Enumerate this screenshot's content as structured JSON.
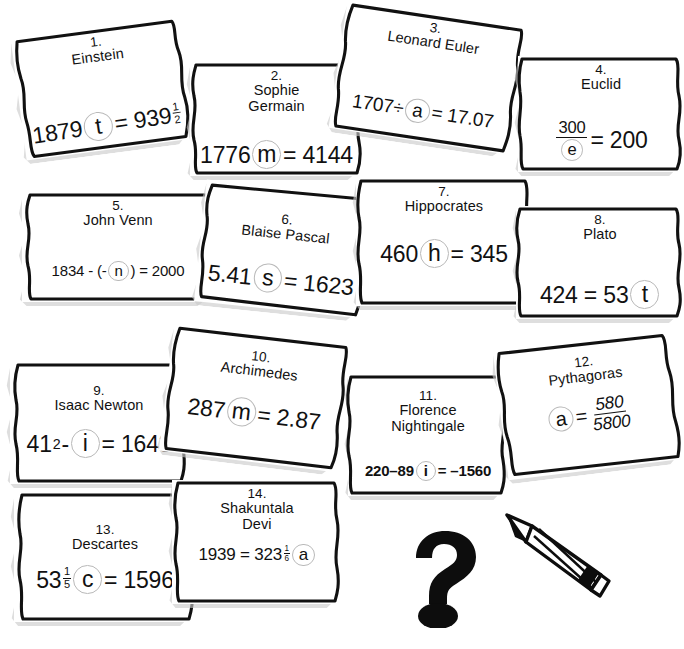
{
  "sheet": {
    "width": 684,
    "height": 649,
    "background": "#ffffff",
    "ink_color": "#111111",
    "bubble_color": "#b9b9b9",
    "shadow_color": "#c9c9c9"
  },
  "cards": [
    {
      "number": "1.",
      "name": "Einstein",
      "equation_text": "1879 t = 939 1/2",
      "eq_parts": [
        {
          "t": "1879",
          "k": "plain"
        },
        {
          "t": "t",
          "k": "bubble"
        },
        {
          "t": " = 939",
          "k": "plain"
        },
        {
          "t": "1/2",
          "k": "mixfrac",
          "n": "1",
          "d": "2"
        }
      ]
    },
    {
      "number": "2.",
      "name": "Sophie\nGermain",
      "equation_text": "1776 m = 4144",
      "eq_parts": [
        {
          "t": "1776",
          "k": "plain"
        },
        {
          "t": "m",
          "k": "bubble"
        },
        {
          "t": " = 4144",
          "k": "plain"
        }
      ]
    },
    {
      "number": "3.",
      "name": "Leonard Euler",
      "equation_text": "1707 ÷ a = 17.07",
      "eq_parts": [
        {
          "t": "1707÷",
          "k": "plain"
        },
        {
          "t": "a",
          "k": "bubble"
        },
        {
          "t": "= 17.07",
          "k": "plain"
        }
      ]
    },
    {
      "number": "4.",
      "name": "Euclid",
      "equation_text": "300 / e = 200",
      "eq_parts": [
        {
          "t": "300/e",
          "k": "frac",
          "n": "300",
          "d": "e",
          "d_bubble": true
        },
        {
          "t": " = 200",
          "k": "plain"
        }
      ]
    },
    {
      "number": "5.",
      "name": "John Venn",
      "equation_text": "1834 - (-n) = 2000",
      "eq_parts": [
        {
          "t": "1834 - (-",
          "k": "plain"
        },
        {
          "t": "n",
          "k": "bubble"
        },
        {
          "t": ") = 2000",
          "k": "plain"
        }
      ]
    },
    {
      "number": "6.",
      "name": "Blaise Pascal",
      "equation_text": "5.41 s = 1623",
      "eq_parts": [
        {
          "t": "5.41",
          "k": "plain"
        },
        {
          "t": "s",
          "k": "bubble"
        },
        {
          "t": "= 1623",
          "k": "plain"
        }
      ]
    },
    {
      "number": "7.",
      "name": "Hippocrates",
      "equation_text": "460 h = 345",
      "eq_parts": [
        {
          "t": "460",
          "k": "plain"
        },
        {
          "t": "h",
          "k": "bubble"
        },
        {
          "t": "= 345",
          "k": "plain"
        }
      ]
    },
    {
      "number": "8.",
      "name": "Plato",
      "equation_text": "424 = 53 t",
      "eq_parts": [
        {
          "t": "424 = 53",
          "k": "plain"
        },
        {
          "t": "t",
          "k": "bubble"
        }
      ]
    },
    {
      "number": "9.",
      "name": "Isaac Newton",
      "equation_text": "41² - i = 1643",
      "eq_parts": [
        {
          "t": "41",
          "k": "plain"
        },
        {
          "t": "2",
          "k": "sup"
        },
        {
          "t": " -",
          "k": "plain"
        },
        {
          "t": "i",
          "k": "bubble"
        },
        {
          "t": "= 1643",
          "k": "plain"
        }
      ]
    },
    {
      "number": "10.",
      "name": "Archimedes",
      "equation_text": "287 m = 2.87",
      "eq_parts": [
        {
          "t": "287",
          "k": "plain"
        },
        {
          "t": "m",
          "k": "bubble"
        },
        {
          "t": "= 2.87",
          "k": "plain"
        }
      ]
    },
    {
      "number": "11.",
      "name": "Florence\nNightingale",
      "equation_text": "220 - 89 i = -1560",
      "eq_parts": [
        {
          "t": "220 – 89",
          "k": "plain"
        },
        {
          "t": "i",
          "k": "bubble"
        },
        {
          "t": " = –1560",
          "k": "plain"
        }
      ]
    },
    {
      "number": "12.",
      "name": "Pythagoras",
      "equation_text": "a = 580 / 5800",
      "eq_parts": [
        {
          "t": "a",
          "k": "bubble"
        },
        {
          "t": " = ",
          "k": "plain"
        },
        {
          "t": "580/5800",
          "k": "frac",
          "n": "580",
          "d": "5800",
          "italic": true
        }
      ]
    },
    {
      "number": "13.",
      "name": "Descartes",
      "equation_text": "53 1/5 c = 1596",
      "eq_parts": [
        {
          "t": "53",
          "k": "plain"
        },
        {
          "t": "1/5",
          "k": "mixfrac",
          "n": "1",
          "d": "5"
        },
        {
          "t": "c",
          "k": "bubble"
        },
        {
          "t": "= 1596",
          "k": "plain"
        }
      ]
    },
    {
      "number": "14.",
      "name": "Shakuntala\nDevi",
      "equation_text": "1939 = 323 1/6 a",
      "eq_parts": [
        {
          "t": "1939 = 323",
          "k": "plain"
        },
        {
          "t": "1/6",
          "k": "mixfrac",
          "n": "1",
          "d": "6"
        },
        {
          "t": "a",
          "k": "bubble"
        }
      ]
    }
  ],
  "decorations": [
    {
      "name": "question-mark-icon",
      "glyph": "?"
    },
    {
      "name": "pencil-icon",
      "glyph": "✏"
    }
  ]
}
